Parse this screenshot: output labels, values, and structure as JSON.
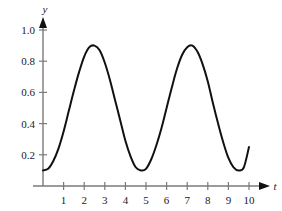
{
  "chart_data": {
    "type": "line",
    "title": "",
    "subtitle": "",
    "xlabel": "t",
    "ylabel": "y",
    "xlim": [
      0,
      10.45
    ],
    "ylim": [
      0,
      1.1
    ],
    "grid": false,
    "legend": null,
    "axis_style": "arrow-axes",
    "x_ticks": [
      1,
      2,
      3,
      4,
      5,
      6,
      7,
      8,
      9,
      10
    ],
    "x_tick_labels": [
      "1",
      "2",
      "3",
      "4",
      "5",
      "6",
      "7",
      "8",
      "9",
      "10"
    ],
    "y_ticks": [
      0.2,
      0.4,
      0.6,
      0.8,
      1.0
    ],
    "y_tick_labels": [
      "0.2",
      "0.4",
      "0.6",
      "0.8",
      "1.0"
    ],
    "series": [
      {
        "name": "oscillation",
        "color": "#111111",
        "linewidth": 2,
        "description": "sinusoidal oscillation with amplitude 0.4 about mean 0.5, period 3.5, minimum 0.1, maximum 0.9",
        "x": [
          0.0,
          0.25,
          0.5,
          0.75,
          1.0,
          1.25,
          1.5,
          1.75,
          2.0,
          2.25,
          2.5,
          2.75,
          3.0,
          3.25,
          3.5,
          3.75,
          4.0,
          4.25,
          4.5,
          4.75,
          5.0,
          5.25,
          5.5,
          5.75,
          6.0,
          6.25,
          6.5,
          6.75,
          7.0,
          7.25,
          7.5,
          7.75,
          8.0,
          8.25,
          8.5,
          8.75,
          9.0,
          9.25,
          9.5,
          9.75,
          10.0
        ],
        "y": [
          0.1,
          0.11,
          0.16,
          0.24,
          0.35,
          0.48,
          0.61,
          0.73,
          0.83,
          0.89,
          0.9,
          0.87,
          0.79,
          0.68,
          0.55,
          0.42,
          0.29,
          0.19,
          0.12,
          0.1,
          0.11,
          0.17,
          0.26,
          0.37,
          0.5,
          0.63,
          0.75,
          0.84,
          0.89,
          0.9,
          0.86,
          0.78,
          0.67,
          0.53,
          0.4,
          0.28,
          0.18,
          0.12,
          0.1,
          0.12,
          0.25
        ]
      }
    ],
    "annotations": []
  },
  "axis": {
    "x_name": "t",
    "y_name": "y",
    "color": "#7a7a7a"
  }
}
